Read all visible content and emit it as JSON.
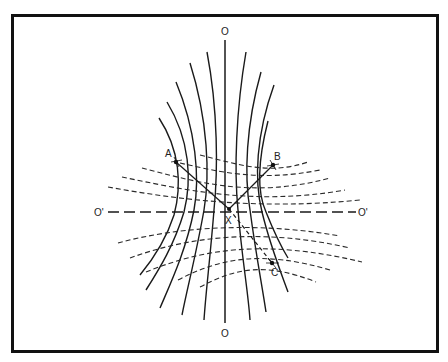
{
  "diagram": {
    "colors": {
      "ink": "#1a1a1a",
      "background": "#ffffff",
      "frame": "#111111"
    },
    "labels": {
      "top_axis": "O",
      "bottom_axis": "O",
      "left_axis": "O'",
      "right_axis": "O'",
      "point_a": "A",
      "point_b": "B",
      "point_c": "C",
      "intersection": "X"
    },
    "elements": {
      "vertical_axis": "solid line O–O",
      "horizontal_axis": "long-dashed line O'–O'",
      "solid_field_lines": "hyperbola-like curves pinched toward vertical axis",
      "dashed_field_lines": "hyperbola-like curves spreading toward horizontal axis",
      "rays": [
        "X to A (solid)",
        "X to B (solid)",
        "X to C (dashed)"
      ]
    }
  }
}
